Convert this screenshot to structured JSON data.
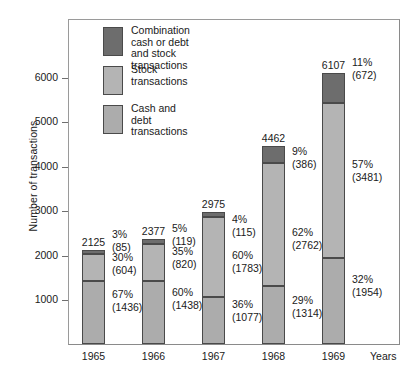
{
  "chart_data": {
    "type": "bar",
    "subtype": "stacked-bar",
    "title": "",
    "xlabel": "Years",
    "ylabel": "Number of transactions",
    "categories": [
      "1965",
      "1966",
      "1967",
      "1968",
      "1969"
    ],
    "ylim": [
      0,
      6500
    ],
    "yticks": [
      1000,
      2000,
      3000,
      4000,
      5000,
      6000
    ],
    "ytick_labels": [
      "1000",
      "2000",
      "3000",
      "4000",
      "5000",
      "6000"
    ],
    "grid": false,
    "legend_position": "inside-upper-left",
    "totals": [
      2125,
      2377,
      2975,
      4462,
      6107
    ],
    "total_labels": [
      "2125",
      "2377",
      "2975",
      "4462",
      "6107"
    ],
    "series": [
      {
        "name": "Combination cash or debt and stock transactions",
        "color": "#6d6d6d",
        "values": [
          85,
          119,
          115,
          386,
          672
        ],
        "percents": [
          3,
          5,
          4,
          9,
          11
        ],
        "percent_labels": [
          "3%",
          "5%",
          "4%",
          "9%",
          "11%"
        ],
        "value_labels": [
          "(85)",
          "(119)",
          "(115)",
          "(386)",
          "(672)"
        ]
      },
      {
        "name": "Stock transactions",
        "color": "#b4b4b4",
        "values": [
          604,
          820,
          1783,
          2762,
          3481
        ],
        "percents": [
          30,
          35,
          60,
          62,
          57
        ],
        "percent_labels": [
          "30%",
          "35%",
          "60%",
          "62%",
          "57%"
        ],
        "value_labels": [
          "(604)",
          "(820)",
          "(1783)",
          "(2762)",
          "(3481)"
        ]
      },
      {
        "name": "Cash and debt transactions",
        "color": "#acacac",
        "values": [
          1436,
          1438,
          1077,
          1314,
          1954
        ],
        "percents": [
          67,
          60,
          36,
          29,
          32
        ],
        "percent_labels": [
          "67%",
          "60%",
          "36%",
          "29%",
          "32%"
        ],
        "value_labels": [
          "(1436)",
          "(1438)",
          "(1077)",
          "(1314)",
          "(1954)"
        ]
      }
    ]
  },
  "axes": {
    "y_title": "Number of transactions",
    "x_title": "Years",
    "y_ticks": [
      {
        "label": "6000"
      },
      {
        "label": "5000"
      },
      {
        "label": "4000"
      },
      {
        "label": "3000"
      },
      {
        "label": "2000"
      },
      {
        "label": "1000"
      }
    ],
    "x_ticks": [
      {
        "label": "1965"
      },
      {
        "label": "1966"
      },
      {
        "label": "1967"
      },
      {
        "label": "1968"
      },
      {
        "label": "1969"
      }
    ]
  },
  "legend": {
    "items": [
      {
        "label": "Combination\ncash or debt\nand stock\ntransactions",
        "color": "#6d6d6d"
      },
      {
        "label": "Stock\ntransactions",
        "color": "#b4b4b4"
      },
      {
        "label": "Cash and\ndebt\ntransactions",
        "color": "#acacac"
      }
    ]
  },
  "bar_totals": [
    {
      "label": "2125"
    },
    {
      "label": "2377"
    },
    {
      "label": "2975"
    },
    {
      "label": "4462"
    },
    {
      "label": "6107"
    }
  ],
  "annotations": [
    {
      "percent": "3%",
      "count": "(85)"
    },
    {
      "percent": "30%",
      "count": "(604)"
    },
    {
      "percent": "67%",
      "count": "(1436)"
    },
    {
      "percent": "5%",
      "count": "(119)"
    },
    {
      "percent": "35%",
      "count": "(820)"
    },
    {
      "percent": "60%",
      "count": "(1438)"
    },
    {
      "percent": "4%",
      "count": "(115)"
    },
    {
      "percent": "60%",
      "count": "(1783)"
    },
    {
      "percent": "36%",
      "count": "(1077)"
    },
    {
      "percent": "9%",
      "count": "(386)"
    },
    {
      "percent": "62%",
      "count": "(2762)"
    },
    {
      "percent": "29%",
      "count": "(1314)"
    },
    {
      "percent": "11%",
      "count": "(672)"
    },
    {
      "percent": "57%",
      "count": "(3481)"
    },
    {
      "percent": "32%",
      "count": "(1954)"
    }
  ]
}
